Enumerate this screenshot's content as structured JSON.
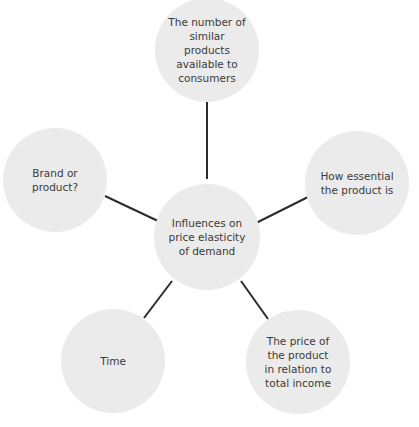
{
  "diagram": {
    "type": "mind-map",
    "central": {
      "label": "Influences on\nprice elasticity\nof demand"
    },
    "nodes": [
      {
        "id": "similar-products",
        "label": "The number of\nsimilar products\navailable to\nconsumers"
      },
      {
        "id": "how-essential",
        "label": "How essential\nthe product is"
      },
      {
        "id": "price-income",
        "label": "The price of\nthe product\nin relation to\ntotal income"
      },
      {
        "id": "time",
        "label": "Time"
      },
      {
        "id": "brand-product",
        "label": "Brand or\nproduct?"
      }
    ],
    "colors": {
      "node_fill": "#ebebeb",
      "text": "#3a3a3a",
      "connector": "#2b2b2b",
      "background": "#ffffff"
    }
  }
}
